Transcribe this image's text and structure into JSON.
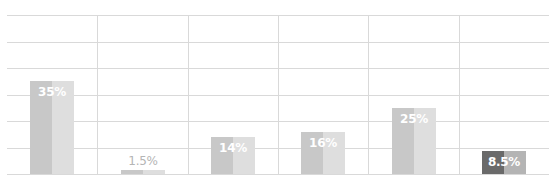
{
  "chart_data": {
    "type": "bar",
    "title": "",
    "xlabel": "",
    "ylabel": "",
    "categories": [
      "",
      "",
      "",
      "",
      "",
      ""
    ],
    "values": [
      35,
      1.5,
      14,
      16,
      25,
      8.5
    ],
    "data_labels": [
      "35%",
      "1.5%",
      "14%",
      "16%",
      "25%",
      "8.5%"
    ],
    "ylim": [
      0,
      60
    ],
    "grid": true,
    "legend": null,
    "colors": {
      "default_left": "#c8c8c8",
      "default_right": "#dedede",
      "highlight_left": "#6a6a6a",
      "highlight_right": "#b4b4b4",
      "label_inside": "#ffffff",
      "label_outside": "#b5b5b5",
      "grid": "#d9d9d9"
    },
    "highlight_index": 5
  }
}
